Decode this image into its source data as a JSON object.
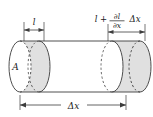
{
  "figure": {
    "type": "physics-diagram",
    "background_color": "#ffffff",
    "outline_color": "#3c3c3c",
    "shade_color": "#e0e0e0",
    "text_color": "#1a1a1a"
  },
  "labels": {
    "area": "A",
    "left_thickness": "l",
    "right_thickness_base": "l",
    "right_plus": "+",
    "right_numerator": "∂l",
    "right_denominator": "∂x",
    "right_delta": "Δx",
    "axial_length_delta": "Δ",
    "axial_length_var": "x",
    "axial_length": "Δx"
  },
  "geometry": {
    "cylinder_left_x": 20,
    "cylinder_right_x": 140,
    "cylinder_top_y": 41,
    "cylinder_bottom_y": 92,
    "ellipse_rx": 11,
    "ellipse_ry": 25.5,
    "left_slab_start_x": 20,
    "left_slab_end_x": 39,
    "right_slab_start_x": 112,
    "right_slab_end_x": 140,
    "dim_left_y": 26,
    "dim_right_y": 28,
    "dim_bottom_y": 105
  }
}
